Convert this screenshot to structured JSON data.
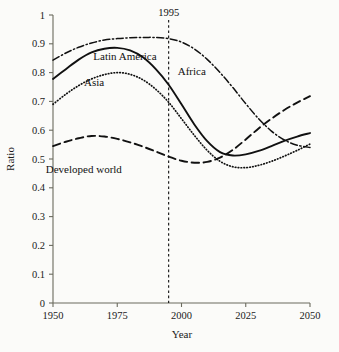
{
  "chart_data": {
    "type": "line",
    "title": "",
    "xlabel": "Year",
    "ylabel": "Ratio",
    "xlim": [
      1950,
      2050
    ],
    "ylim": [
      0,
      1
    ],
    "grid": false,
    "legend_position": "inline-annotations",
    "xticks": [
      "1950",
      "1975",
      "2000",
      "2025",
      "2050"
    ],
    "xtick_values": [
      1950,
      1975,
      2000,
      2025,
      2050
    ],
    "yticks": [
      "0",
      "0.1",
      "0.2",
      "0.3",
      "0.4",
      "0.5",
      "0.6",
      "0.7",
      "0.8",
      "0.9",
      "1"
    ],
    "ytick_values": [
      0,
      0.1,
      0.2,
      0.3,
      0.4,
      0.5,
      0.6,
      0.7,
      0.8,
      0.9,
      1
    ],
    "annotations": [
      {
        "text": "1995",
        "x": 1995,
        "type": "vertical-reference-line"
      }
    ],
    "x": [
      1950,
      1955,
      1960,
      1965,
      1970,
      1975,
      1980,
      1985,
      1990,
      1995,
      2000,
      2005,
      2010,
      2015,
      2020,
      2025,
      2030,
      2035,
      2040,
      2045,
      2050
    ],
    "series": [
      {
        "name": "Latin America",
        "style": "solid",
        "label_x": 1978,
        "label_y": 0.845,
        "values": [
          0.778,
          0.812,
          0.845,
          0.87,
          0.883,
          0.886,
          0.877,
          0.853,
          0.812,
          0.758,
          0.69,
          0.62,
          0.562,
          0.524,
          0.512,
          0.516,
          0.528,
          0.545,
          0.563,
          0.578,
          0.59
        ]
      },
      {
        "name": "Asia",
        "style": "dotted",
        "label_x": 1966,
        "label_y": 0.752,
        "values": [
          0.69,
          0.725,
          0.755,
          0.778,
          0.793,
          0.8,
          0.794,
          0.775,
          0.742,
          0.697,
          0.64,
          0.582,
          0.53,
          0.492,
          0.473,
          0.47,
          0.478,
          0.492,
          0.51,
          0.53,
          0.552
        ]
      },
      {
        "name": "Africa",
        "style": "dash-dot",
        "label_x": 2004,
        "label_y": 0.79,
        "values": [
          0.843,
          0.868,
          0.888,
          0.903,
          0.913,
          0.918,
          0.921,
          0.922,
          0.922,
          0.918,
          0.906,
          0.882,
          0.846,
          0.8,
          0.748,
          0.692,
          0.64,
          0.597,
          0.566,
          0.548,
          0.54
        ]
      },
      {
        "name": "Developed world",
        "style": "dashed",
        "label_x": 1962,
        "label_y": 0.452,
        "values": [
          0.545,
          0.56,
          0.572,
          0.58,
          0.578,
          0.57,
          0.558,
          0.543,
          0.526,
          0.508,
          0.494,
          0.487,
          0.49,
          0.505,
          0.532,
          0.568,
          0.606,
          0.64,
          0.67,
          0.696,
          0.718
        ]
      }
    ]
  }
}
